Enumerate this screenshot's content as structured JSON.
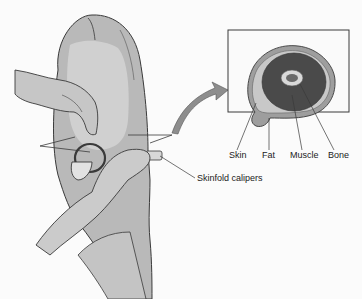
{
  "figure": {
    "labels": {
      "calipers": "Skinfold calipers",
      "skin": "Skin",
      "fat": "Fat",
      "muscle": "Muscle",
      "bone": "Bone"
    },
    "colors": {
      "background": "#fbfbfb",
      "arm": "#b8b8b8",
      "arm_light": "#d4d4d4",
      "outline": "#3a3a3a",
      "muscle": "#4a4a4a",
      "fat": "#a8a8a8",
      "bone": "#d8d8d8"
    }
  }
}
